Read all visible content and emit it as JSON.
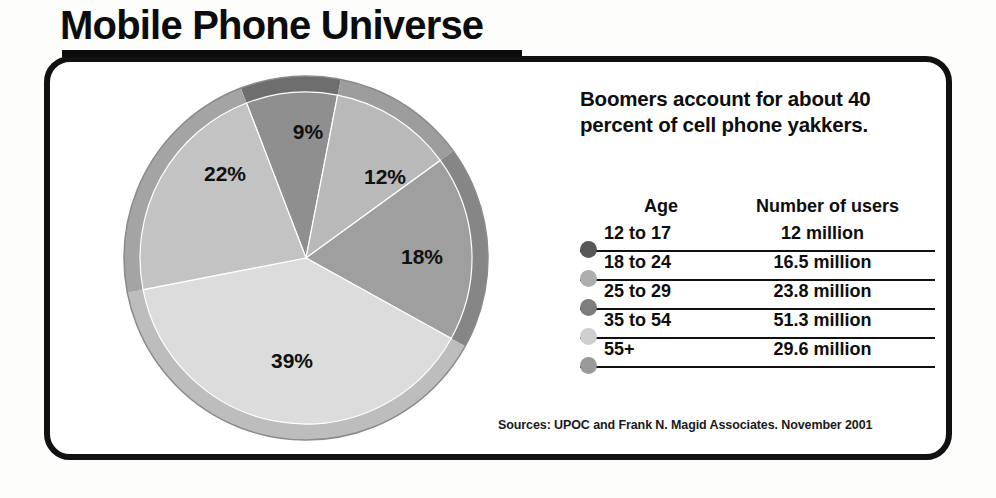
{
  "title": "Mobile Phone Universe",
  "headline": "Boomers account for about 40 percent of cell phone yakkers.",
  "sources": "Sources: UPOC and Frank N. Magid Associates. November 2001",
  "table": {
    "headers": {
      "age": "Age",
      "users": "Number of users"
    },
    "rows": [
      {
        "age": "12 to 17",
        "users": "12 million",
        "dot": "#575757"
      },
      {
        "age": "18 to 24",
        "users": "16.5 million",
        "dot": "#aeaeae"
      },
      {
        "age": "25 to 29",
        "users": "23.8 million",
        "dot": "#7d7d7d"
      },
      {
        "age": "35 to 54",
        "users": "51.3 million",
        "dot": "#cfcfcf"
      },
      {
        "age": "55+",
        "users": "29.6 million",
        "dot": "#9a9a9a"
      }
    ]
  },
  "chart_data": {
    "type": "pie",
    "title": "Mobile Phone Universe",
    "legend_position": "right-table",
    "labels": [
      "12 to 17",
      "18 to 24",
      "25 to 29",
      "35 to 54",
      "55+"
    ],
    "categories": [
      "12 to 17",
      "18 to 24",
      "25 to 29",
      "35 to 54",
      "55+"
    ],
    "values": [
      9,
      12,
      18,
      39,
      22
    ],
    "value_labels": [
      "9%",
      "12%",
      "18%",
      "39%",
      "22%"
    ],
    "absolute_values": [
      12,
      16.5,
      23.8,
      51.3,
      29.6
    ],
    "absolute_units": "million users",
    "colors": [
      "#8f8f8f",
      "#b9b9b9",
      "#9f9f9f",
      "#dcdcdc",
      "#c3c3c3"
    ],
    "rim_colors": [
      "#6e6e6e",
      "#9d9d9d",
      "#868686",
      "#bdbdbd",
      "#a4a4a4"
    ],
    "start_angle_deg": -22,
    "grid": false
  },
  "pie_geometry": {
    "cx": 184,
    "cy": 186,
    "radius_outer": 182,
    "radius_inner": 166,
    "slices": [
      {
        "key": "12 to 17",
        "label": "9%",
        "a0": -21,
        "a1": 11,
        "lx": 186,
        "ly": 61
      },
      {
        "key": "18 to 24",
        "label": "12%",
        "a0": 11,
        "a1": 54,
        "lx": 263,
        "ly": 106
      },
      {
        "key": "25 to 29",
        "label": "18%",
        "a0": 54,
        "a1": 119,
        "lx": 300,
        "ly": 186
      },
      {
        "key": "35 to 54",
        "label": "39%",
        "a0": 119,
        "a1": 259,
        "lx": 170,
        "ly": 290
      },
      {
        "key": "55+",
        "label": "22%",
        "a0": 259,
        "a1": 339,
        "lx": 103,
        "ly": 103
      }
    ]
  }
}
